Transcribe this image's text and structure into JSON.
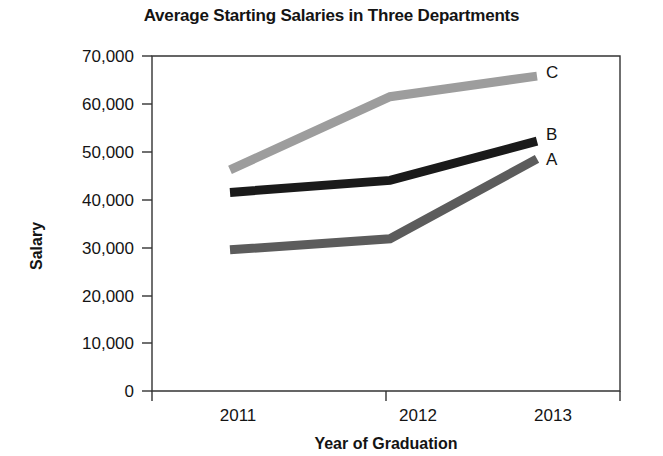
{
  "chart_data": {
    "type": "line",
    "title": "Average Starting Salaries in Three Departments",
    "xlabel": "Year of Graduation",
    "ylabel": "Salary",
    "categories": [
      "2011",
      "2012",
      "2013"
    ],
    "x": [
      2011,
      2012,
      2013
    ],
    "series": [
      {
        "name": "A",
        "label": "A",
        "color": "#5c5c5c",
        "values": [
          29500,
          31800,
          48500
        ]
      },
      {
        "name": "B",
        "label": "B",
        "color": "#1a1a1a",
        "values": [
          41500,
          44000,
          52200
        ]
      },
      {
        "name": "C",
        "label": "C",
        "color": "#9d9d9d",
        "values": [
          46200,
          61500,
          65800
        ]
      }
    ],
    "ylim": [
      0,
      70000
    ],
    "yticks": [
      0,
      10000,
      20000,
      30000,
      40000,
      50000,
      60000,
      70000
    ],
    "ytick_labels": [
      "0",
      "10,000",
      "20,000",
      "30,000",
      "40,000",
      "50,000",
      "60,000",
      "70,000"
    ],
    "xtick_labels": [
      "2011",
      "2012",
      "2013"
    ],
    "grid": false,
    "legend_position": "line-end-labels"
  },
  "axis": {
    "y_tick_0": "0",
    "y_tick_1": "10,000",
    "y_tick_2": "20,000",
    "y_tick_3": "30,000",
    "y_tick_4": "40,000",
    "y_tick_5": "50,000",
    "y_tick_6": "60,000",
    "y_tick_7": "70,000",
    "x_tick_0": "2011",
    "x_tick_1": "2012",
    "x_tick_2": "2013",
    "y_title": "Salary",
    "x_title": "Year of Graduation"
  },
  "labels": {
    "series_a": "A",
    "series_b": "B",
    "series_c": "C"
  }
}
